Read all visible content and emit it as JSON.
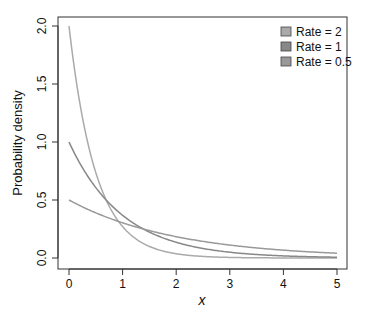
{
  "chart_data": {
    "type": "line",
    "title": "",
    "xlabel": "x",
    "ylabel": "Probability density",
    "xlim": [
      0,
      5
    ],
    "ylim": [
      0,
      2
    ],
    "xticks": [
      "0",
      "1",
      "2",
      "3",
      "4",
      "5"
    ],
    "yticks": [
      "0.0",
      "0.5",
      "1.0",
      "1.5",
      "2.0"
    ],
    "grid": false,
    "legend_position": "top-right",
    "series": [
      {
        "name": "Rate = 2",
        "rate": 2,
        "color": "#aaaaaa",
        "formula": "2*exp(-2x)"
      },
      {
        "name": "Rate = 1",
        "rate": 1,
        "color": "#888888",
        "formula": "exp(-x)"
      },
      {
        "name": "Rate = 0.5",
        "rate": 0.5,
        "color": "#999999",
        "formula": "0.5*exp(-0.5x)"
      }
    ],
    "x": [
      0,
      0.5,
      1,
      1.5,
      2,
      2.5,
      3,
      3.5,
      4,
      4.5,
      5
    ]
  }
}
